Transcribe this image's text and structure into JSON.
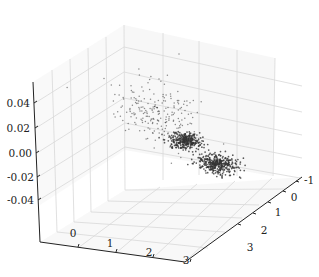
{
  "chart_data": {
    "type": "scatter",
    "projection": "3d",
    "title": "",
    "xlabel": "",
    "ylabel": "",
    "zlabel": "",
    "grid": true,
    "legend": null,
    "x_ticks": [
      "0",
      "1",
      "2",
      "3"
    ],
    "y_ticks": [
      "-1",
      "0",
      "1",
      "2",
      "3"
    ],
    "z_ticks": [
      "0.04",
      "0.02",
      "0.00",
      "-0.02",
      "-0.04"
    ],
    "xlim": [
      -1,
      3.6
    ],
    "ylim": [
      -1.4,
      3.6
    ],
    "zlim": [
      -0.05,
      0.05
    ],
    "marker_color": "#333333",
    "series": [
      {
        "name": "spread-cloud",
        "center": {
          "x": 0.9,
          "y": -0.2,
          "z": 0.02
        },
        "spread": "wide, sparse",
        "approx_points": 220
      },
      {
        "name": "cluster-mid",
        "center": {
          "x": 1.9,
          "y": 1.2,
          "z": 0.0
        },
        "spread": "tight, dense",
        "approx_points": 300
      },
      {
        "name": "cluster-front",
        "center": {
          "x": 2.8,
          "y": 1.8,
          "z": -0.005
        },
        "spread": "tight, dense",
        "approx_points": 350
      }
    ]
  },
  "axes": {
    "z": {
      "ticks": [
        {
          "label": "0.04"
        },
        {
          "label": "0.02"
        },
        {
          "label": "0.00"
        },
        {
          "label": "-0.02"
        },
        {
          "label": "-0.04"
        }
      ]
    },
    "x": {
      "ticks": [
        {
          "label": "0"
        },
        {
          "label": "1"
        },
        {
          "label": "2"
        },
        {
          "label": "3"
        }
      ]
    },
    "y": {
      "ticks": [
        {
          "label": "-1"
        },
        {
          "label": "0"
        },
        {
          "label": "1"
        },
        {
          "label": "2"
        },
        {
          "label": "3"
        }
      ]
    }
  }
}
